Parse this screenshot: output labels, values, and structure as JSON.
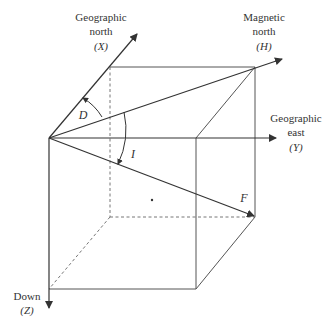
{
  "diagram": {
    "type": "geomagnetic-field-components",
    "line_color": "#333333",
    "axes": {
      "x": {
        "label_line1": "Geographic",
        "label_line2": "north",
        "symbol": "(X)"
      },
      "y": {
        "label_line1": "Geographic",
        "label_line2": "east",
        "symbol": "(Y)"
      },
      "z": {
        "label_line1": "Down",
        "symbol": "(Z)"
      },
      "h": {
        "label_line1": "Magnetic",
        "label_line2": "north",
        "symbol": "(H)"
      }
    },
    "angles": {
      "declination": "D",
      "inclination": "I"
    },
    "vectors": {
      "total_field": "F"
    }
  }
}
